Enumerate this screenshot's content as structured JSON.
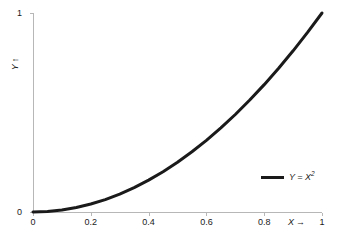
{
  "chart_data": {
    "type": "line",
    "title": "",
    "subtitle": "",
    "xlabel": "X",
    "ylabel": "Y",
    "xlabel_arrow": "→",
    "ylabel_arrow": "↑",
    "xlim": [
      0,
      1
    ],
    "ylim": [
      0,
      1
    ],
    "grid": false,
    "legend_position": "inside-bottom-right",
    "x_ticks": [
      "0",
      "0.2",
      "0.4",
      "0.6",
      "0.8",
      "1"
    ],
    "x_tick_values": [
      0,
      0.2,
      0.4,
      0.6,
      0.8,
      1
    ],
    "y_ticks": [
      "0",
      "1"
    ],
    "y_tick_values": [
      0,
      1
    ],
    "series": [
      {
        "name": "Y = X",
        "name_superscript": "2",
        "color": "#1a1a1a",
        "line_width": 3,
        "x": [
          0,
          0.05,
          0.1,
          0.15,
          0.2,
          0.25,
          0.3,
          0.35,
          0.4,
          0.45,
          0.5,
          0.55,
          0.6,
          0.65,
          0.7,
          0.75,
          0.8,
          0.85,
          0.9,
          0.95,
          1
        ],
        "values": [
          0,
          0.0025,
          0.01,
          0.0225,
          0.04,
          0.0625,
          0.09,
          0.1225,
          0.16,
          0.2025,
          0.25,
          0.3025,
          0.36,
          0.4225,
          0.49,
          0.5625,
          0.64,
          0.7225,
          0.81,
          0.9025,
          1
        ]
      }
    ],
    "annotations": []
  },
  "legend": {
    "label_prefix": "Y = X",
    "label_superscript": "2"
  },
  "colors": {
    "curve": "#1a1a1a",
    "axis": "#b7b7b7",
    "text": "#1a1a1a",
    "background": "#ffffff"
  }
}
